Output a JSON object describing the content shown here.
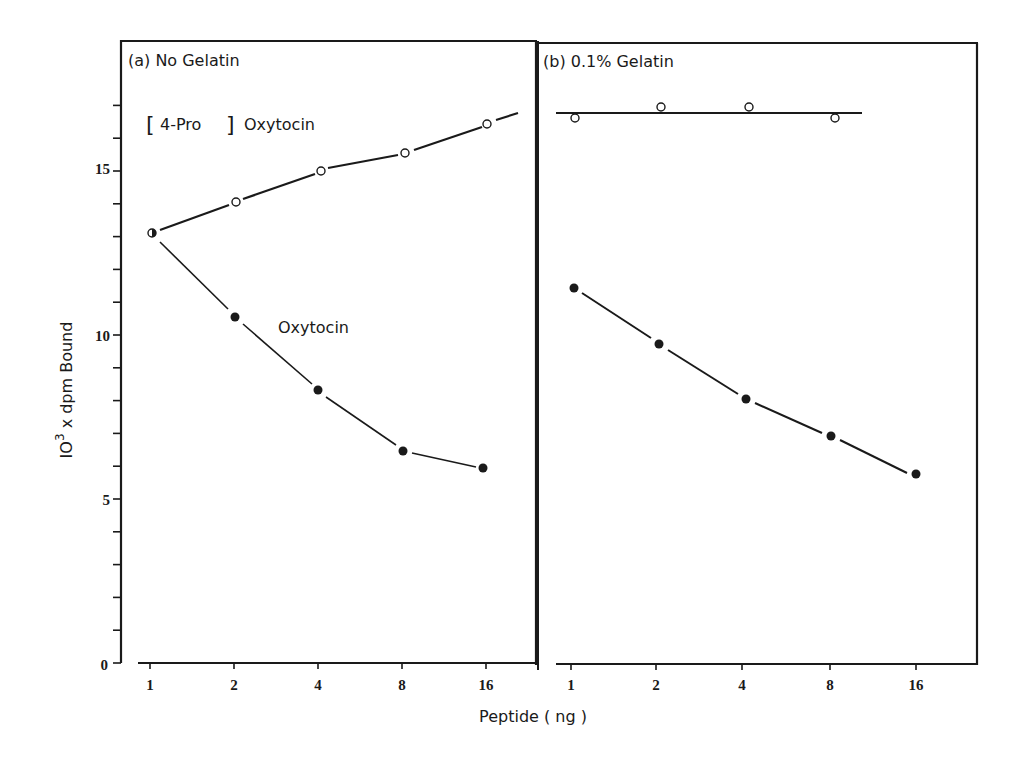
{
  "chart_data": [
    {
      "type": "line",
      "title": "(a) No Gelatin",
      "xlabel": "Peptide (ng)",
      "ylabel": "10^3 x dpm Bound",
      "xscale": "log2",
      "categories": [
        "1",
        "2",
        "4",
        "8",
        "16"
      ],
      "ylim": [
        0,
        17
      ],
      "yticks": [
        "0",
        "5",
        "10",
        "15"
      ],
      "series": [
        {
          "name": "[4-Pro] Oxytocin",
          "marker": "open-circle",
          "values": [
            13.1,
            14.1,
            15.0,
            15.5,
            16.4
          ]
        },
        {
          "name": "Oxytocin",
          "marker": "filled-circle",
          "values": [
            13.1,
            10.5,
            8.3,
            6.5,
            5.9
          ]
        }
      ],
      "annotations": [
        "[4-Pro] Oxytocin",
        "Oxytocin"
      ]
    },
    {
      "type": "line",
      "title": "(b) 0.1% Gelatin",
      "xlabel": "Peptide (ng)",
      "ylabel": "10^3 x dpm Bound",
      "xscale": "log2",
      "categories": [
        "1",
        "2",
        "4",
        "8",
        "16"
      ],
      "ylim": [
        0,
        17
      ],
      "series": [
        {
          "name": "[4-Pro] Oxytocin",
          "marker": "open-circle",
          "values": [
            16.6,
            16.9,
            16.9,
            16.6,
            null
          ],
          "fit_line": 16.8
        },
        {
          "name": "Oxytocin",
          "marker": "filled-circle",
          "values": [
            11.4,
            9.7,
            8.0,
            6.9,
            5.8
          ]
        }
      ]
    }
  ],
  "labels": {
    "panel_a_title": "(a) No Gelatin",
    "panel_b_title": "(b) 0.1% Gelatin",
    "bracket_open": "[",
    "bracket_text": "4-Pro",
    "bracket_close": "]",
    "pro_oxytocin_rest": "Oxytocin",
    "oxytocin": "Oxytocin",
    "xlabel": "Peptide ( ng )",
    "ylabel_base": "IO",
    "ylabel_exp": "3",
    "ylabel_rest": " x  dpm  Bound"
  },
  "ticks": {
    "y": [
      "0",
      "5",
      "10",
      "15"
    ],
    "x": [
      "1",
      "2",
      "4",
      "8",
      "16"
    ]
  }
}
